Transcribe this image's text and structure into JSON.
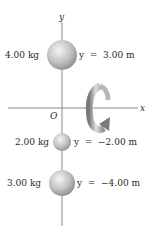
{
  "axes": {
    "x_label": "x",
    "y_label": "y",
    "origin_label": "O"
  },
  "masses": [
    {
      "mass_label": "4.00 kg",
      "position_label": "y  =  3.00 m"
    },
    {
      "mass_label": "2.00 kg",
      "position_label": "y  =  −2.00 m"
    },
    {
      "mass_label": "3.00 kg",
      "position_label": "y  =  −4.00 m"
    }
  ],
  "rotation": {
    "icon": "curved-rotation-arrow-icon",
    "axis": "x"
  },
  "colors": {
    "axis": "#8a8a8a",
    "sphere_light": "#f2f2f2",
    "sphere_dark": "#8c8c8c",
    "arrow_light": "#d9d9d9",
    "arrow_dark": "#7a7a7a",
    "text": "#2a2a2a"
  }
}
